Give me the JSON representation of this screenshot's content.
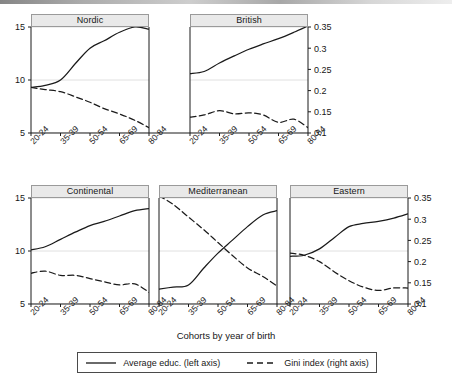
{
  "figure": {
    "xlabel": "Cohorts by year of birth",
    "categories": [
      "20-24",
      "35-39",
      "50-54",
      "65-69",
      "80-84"
    ],
    "left_axis_ticks": [
      "15",
      "10",
      "5"
    ],
    "right_axis_ticks": [
      "0.35",
      "0.3",
      "0.25",
      "0.2",
      "0.15",
      "0.1"
    ],
    "legend": {
      "solid_label": "Average educ. (left axis)",
      "dashed_label": "Gini index (right axis)"
    }
  },
  "chart_data": {
    "type": "line",
    "title": "",
    "xlabel": "Cohorts by year of birth",
    "ylabel": "Average educ.",
    "y2label": "Gini index",
    "grid": true,
    "legend_position": "bottom",
    "categories": [
      "20-24",
      "35-39",
      "50-54",
      "65-69",
      "80-84"
    ],
    "ylim": [
      5,
      15
    ],
    "y2lim": [
      0.1,
      0.35
    ],
    "yticks": [
      5,
      10,
      15
    ],
    "y2ticks": [
      0.1,
      0.15,
      0.2,
      0.25,
      0.3,
      0.35
    ],
    "panels": [
      {
        "name": "Nordic",
        "row": 0,
        "series": [
          {
            "name": "Average educ. (left axis)",
            "axis": "left",
            "style": "solid",
            "x": [
              0,
              0.12,
              0.25,
              0.38,
              0.5,
              0.62,
              0.75,
              0.88,
              1
            ],
            "values": [
              9.3,
              9.5,
              10.0,
              11.6,
              13.0,
              13.7,
              14.5,
              15.0,
              14.8
            ]
          },
          {
            "name": "Gini index (right axis)",
            "axis": "right",
            "style": "dashed",
            "x": [
              0,
              0.12,
              0.25,
              0.38,
              0.5,
              0.62,
              0.75,
              0.88,
              1
            ],
            "values": [
              0.2075,
              0.2025,
              0.1975,
              0.185,
              0.1725,
              0.1575,
              0.145,
              0.13,
              0.1125
            ]
          }
        ]
      },
      {
        "name": "British",
        "row": 0,
        "series": [
          {
            "name": "Average educ. (left axis)",
            "axis": "left",
            "style": "solid",
            "x": [
              0,
              0.12,
              0.25,
              0.38,
              0.5,
              0.62,
              0.75,
              0.88,
              1
            ],
            "values": [
              10.6,
              10.8,
              11.6,
              12.3,
              12.9,
              13.4,
              13.9,
              14.5,
              15.1
            ]
          },
          {
            "name": "Gini index (right axis)",
            "axis": "right",
            "style": "dashed",
            "x": [
              0,
              0.12,
              0.25,
              0.38,
              0.5,
              0.62,
              0.75,
              0.88,
              1
            ],
            "values": [
              0.1375,
              0.1425,
              0.1525,
              0.145,
              0.1475,
              0.1425,
              0.125,
              0.1325,
              0.1125
            ]
          }
        ]
      },
      {
        "name": "Continental",
        "row": 1,
        "series": [
          {
            "name": "Average educ. (left axis)",
            "axis": "left",
            "style": "solid",
            "x": [
              0,
              0.12,
              0.25,
              0.38,
              0.5,
              0.62,
              0.75,
              0.88,
              1
            ],
            "values": [
              10.1,
              10.4,
              11.1,
              11.8,
              12.4,
              12.8,
              13.3,
              13.8,
              14.0
            ]
          },
          {
            "name": "Gini index (right axis)",
            "axis": "right",
            "style": "dashed",
            "x": [
              0,
              0.12,
              0.25,
              0.38,
              0.5,
              0.62,
              0.75,
              0.88,
              1
            ],
            "values": [
              0.1725,
              0.1775,
              0.1675,
              0.1675,
              0.16,
              0.1525,
              0.145,
              0.1475,
              0.1275
            ]
          }
        ]
      },
      {
        "name": "Mediterranean",
        "row": 1,
        "series": [
          {
            "name": "Average educ. (left axis)",
            "axis": "left",
            "style": "solid",
            "x": [
              0,
              0.12,
              0.25,
              0.38,
              0.5,
              0.62,
              0.75,
              0.88,
              1
            ],
            "values": [
              6.4,
              6.6,
              6.8,
              8.4,
              9.8,
              11.0,
              12.3,
              13.4,
              13.8
            ]
          },
          {
            "name": "Gini index (right axis)",
            "axis": "right",
            "style": "dashed",
            "x": [
              0,
              0.12,
              0.25,
              0.38,
              0.5,
              0.62,
              0.75,
              0.88,
              1
            ],
            "values": [
              0.355,
              0.335,
              0.305,
              0.275,
              0.245,
              0.215,
              0.185,
              0.165,
              0.1425
            ]
          }
        ]
      },
      {
        "name": "Eastern",
        "row": 1,
        "series": [
          {
            "name": "Average educ. (left axis)",
            "axis": "left",
            "style": "solid",
            "x": [
              0,
              0.12,
              0.25,
              0.38,
              0.5,
              0.62,
              0.75,
              0.88,
              1
            ],
            "values": [
              9.5,
              9.6,
              10.2,
              11.3,
              12.3,
              12.6,
              12.8,
              13.1,
              13.5
            ]
          },
          {
            "name": "Gini index (right axis)",
            "axis": "right",
            "style": "dashed",
            "x": [
              0,
              0.12,
              0.25,
              0.38,
              0.5,
              0.62,
              0.75,
              0.88,
              1
            ],
            "values": [
              0.22,
              0.215,
              0.2,
              0.175,
              0.155,
              0.14,
              0.132,
              0.138,
              0.1375
            ]
          }
        ]
      }
    ]
  }
}
